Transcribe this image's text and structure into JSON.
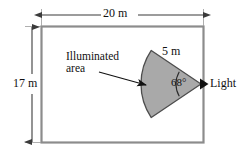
{
  "figure": {
    "room": {
      "width_label": "20 m",
      "height_label": "17 m",
      "width_value": 20,
      "height_value": 17,
      "unit": "m",
      "border_color": "#8c8c8c"
    },
    "light": {
      "label": "Light",
      "marker": "light-triangle-marker",
      "marker_color": "#111111"
    },
    "sector": {
      "radius_label": "5 m",
      "radius_value": 5,
      "angle_label": "68°",
      "angle_value": 68,
      "fill_color": "#a9a9a9",
      "stroke_color": "#4d4d4d"
    },
    "annotation": {
      "line1": "Illuminated",
      "line2": "area",
      "pointer": "leader-arrow"
    },
    "dimensions": {
      "top_arrow": "horizontal-dimension-arrow",
      "left_arrow": "vertical-dimension-arrow",
      "line_color": "#3b3b3b"
    }
  }
}
